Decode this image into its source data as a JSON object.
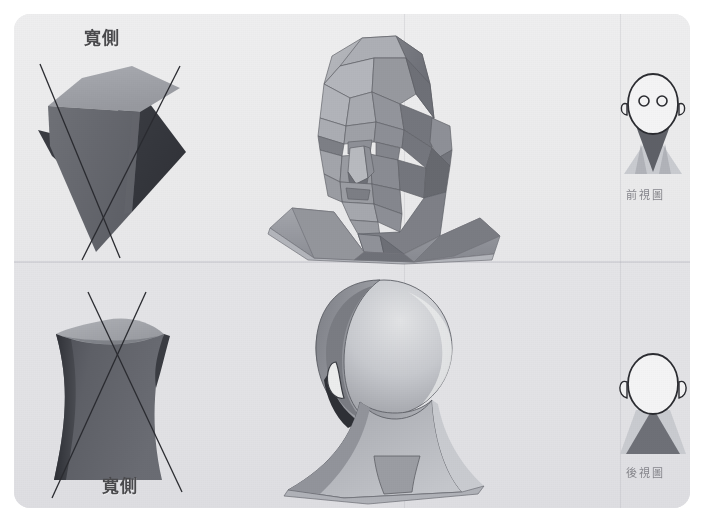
{
  "figure": {
    "title": "",
    "background_color": "#ffffff",
    "panel_color": "#eaeaec",
    "accent_dark": "#5f6167",
    "accent_mid": "#8b8d93",
    "accent_light": "#bfc1c6"
  },
  "panels": [
    {
      "id": "top-row",
      "label": "",
      "items": [
        {
          "id": "top-left-solid",
          "kind": "geometric-wedge",
          "caption": "寬側"
        },
        {
          "id": "top-center-head",
          "kind": "faceted-head-3qtr",
          "caption": ""
        },
        {
          "id": "top-right-icon",
          "kind": "front-view-icon",
          "caption": "前視圖"
        }
      ]
    },
    {
      "id": "bottom-row",
      "label": "",
      "items": [
        {
          "id": "bottom-left-solid",
          "kind": "hourglass-ruled-surface",
          "caption": "寬側"
        },
        {
          "id": "bottom-center-head",
          "kind": "smooth-head-back",
          "caption": ""
        },
        {
          "id": "bottom-right-icon",
          "kind": "back-view-icon",
          "caption": "後視圖"
        }
      ]
    }
  ],
  "labels": {
    "wide_side_top": "寬側",
    "wide_side_bottom": "寬側",
    "front_view": "前視圖",
    "back_view": "後視圖"
  },
  "icons": {
    "front_view_icon": "front-view-head-icon",
    "back_view_icon": "back-view-head-icon",
    "wedge_icon": "geometric-wedge-solid",
    "hourglass_icon": "hourglass-ruled-solid",
    "head_3qtr_icon": "faceted-head-three-quarter",
    "head_back_icon": "smooth-head-back"
  }
}
